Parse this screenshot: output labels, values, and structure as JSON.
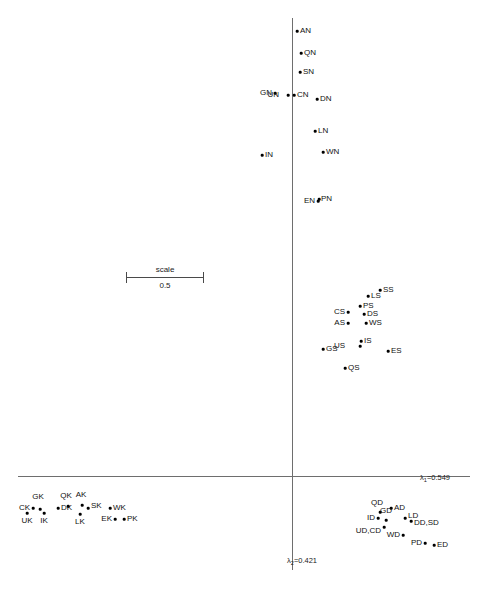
{
  "chart_data": {
    "type": "scatter",
    "title": "",
    "xlabel": "λ₁=0.549",
    "ylabel": "λ₂=0.421",
    "axis": {
      "horizontal_label": "λ",
      "horizontal_sub": "1",
      "horizontal_value": "=0.549",
      "vertical_label": "λ",
      "vertical_sub": "2",
      "vertical_value": "=0.421",
      "origin_x_px": 292,
      "origin_y_px": 476,
      "grid": false,
      "legend": "none"
    },
    "scale_bar": {
      "caption": "scale",
      "value": "0.5",
      "x_start_px": 126,
      "x_end_px": 203,
      "y_px": 277
    },
    "points": [
      {
        "label": "AN",
        "x": 297,
        "y": 31,
        "lx": 300,
        "ly": 31,
        "pos": "right"
      },
      {
        "label": "QN",
        "x": 301,
        "y": 53,
        "lx": 304,
        "ly": 53,
        "pos": "right"
      },
      {
        "label": "SN",
        "x": 300,
        "y": 72,
        "lx": 303,
        "ly": 72,
        "pos": "right"
      },
      {
        "label": "GN",
        "x": 275,
        "y": 93,
        "lx": 272,
        "ly": 93,
        "pos": "left"
      },
      {
        "label": "UN",
        "x": 288,
        "y": 95,
        "lx": 279,
        "ly": 95,
        "pos": "left-inline"
      },
      {
        "label": "CN",
        "x": 294,
        "y": 95,
        "lx": 297,
        "ly": 95,
        "pos": "right"
      },
      {
        "label": "DN",
        "x": 317,
        "y": 99,
        "lx": 320,
        "ly": 99,
        "pos": "right"
      },
      {
        "label": "LN",
        "x": 315,
        "y": 131,
        "lx": 318,
        "ly": 131,
        "pos": "right"
      },
      {
        "label": "WN",
        "x": 323,
        "y": 152,
        "lx": 326,
        "ly": 152,
        "pos": "right"
      },
      {
        "label": "IN",
        "x": 262,
        "y": 155,
        "lx": 265,
        "ly": 155,
        "pos": "right"
      },
      {
        "label": "EN",
        "x": 318,
        "y": 201,
        "lx": 315,
        "ly": 201,
        "pos": "left"
      },
      {
        "label": "PN",
        "x": 319,
        "y": 199,
        "lx": 321,
        "ly": 199,
        "pos": "right"
      },
      {
        "label": "SS",
        "x": 380,
        "y": 290,
        "lx": 383,
        "ly": 290,
        "pos": "right"
      },
      {
        "label": "LS",
        "x": 368,
        "y": 296,
        "lx": 371,
        "ly": 296,
        "pos": "right"
      },
      {
        "label": "PS",
        "x": 360,
        "y": 306,
        "lx": 363,
        "ly": 306,
        "pos": "right"
      },
      {
        "label": "CS",
        "x": 348,
        "y": 312,
        "lx": 345,
        "ly": 312,
        "pos": "left"
      },
      {
        "label": "DS",
        "x": 364,
        "y": 314,
        "lx": 367,
        "ly": 314,
        "pos": "right"
      },
      {
        "label": "AS",
        "x": 348,
        "y": 323,
        "lx": 345,
        "ly": 323,
        "pos": "left"
      },
      {
        "label": "WS",
        "x": 366,
        "y": 323,
        "lx": 369,
        "ly": 323,
        "pos": "right"
      },
      {
        "label": "IS",
        "x": 361,
        "y": 341,
        "lx": 364,
        "ly": 341,
        "pos": "right"
      },
      {
        "label": "GS",
        "x": 323,
        "y": 349,
        "lx": 326,
        "ly": 349,
        "pos": "right"
      },
      {
        "label": "US",
        "x": 360,
        "y": 346,
        "lx": 345,
        "ly": 346,
        "pos": "left-inline"
      },
      {
        "label": "ES",
        "x": 388,
        "y": 351,
        "lx": 391,
        "ly": 351,
        "pos": "right"
      },
      {
        "label": "QS",
        "x": 345,
        "y": 368,
        "lx": 348,
        "ly": 368,
        "pos": "right"
      },
      {
        "label": "CK",
        "x": 33,
        "y": 508,
        "lx": 30,
        "ly": 508,
        "pos": "left"
      },
      {
        "label": "GK",
        "x": 40,
        "y": 509,
        "lx": 38,
        "ly": 501,
        "pos": "above"
      },
      {
        "label": "UK",
        "x": 27,
        "y": 513,
        "lx": 27,
        "ly": 517,
        "pos": "below"
      },
      {
        "label": "IK",
        "x": 44,
        "y": 513,
        "lx": 44,
        "ly": 517,
        "pos": "below"
      },
      {
        "label": "DK",
        "x": 58,
        "y": 508,
        "lx": 61,
        "ly": 508,
        "pos": "right"
      },
      {
        "label": "QK",
        "x": 68,
        "y": 506,
        "lx": 66,
        "ly": 500,
        "pos": "above"
      },
      {
        "label": "AK",
        "x": 82,
        "y": 505,
        "lx": 81,
        "ly": 499,
        "pos": "above"
      },
      {
        "label": "SK",
        "x": 88,
        "y": 508,
        "lx": 91,
        "ly": 506,
        "pos": "right"
      },
      {
        "label": "LK",
        "x": 80,
        "y": 514,
        "lx": 80,
        "ly": 518,
        "pos": "below"
      },
      {
        "label": "WK",
        "x": 110,
        "y": 508,
        "lx": 113,
        "ly": 508,
        "pos": "right"
      },
      {
        "label": "EK",
        "x": 115,
        "y": 519,
        "lx": 112,
        "ly": 519,
        "pos": "left"
      },
      {
        "label": "PK",
        "x": 124,
        "y": 519,
        "lx": 127,
        "ly": 519,
        "pos": "right"
      },
      {
        "label": "QD",
        "x": 380,
        "y": 512,
        "lx": 377,
        "ly": 507,
        "pos": "above"
      },
      {
        "label": "AD",
        "x": 391,
        "y": 508,
        "lx": 394,
        "ly": 508,
        "pos": "right"
      },
      {
        "label": "ID",
        "x": 378,
        "y": 518,
        "lx": 375,
        "ly": 518,
        "pos": "left"
      },
      {
        "label": "GD",
        "x": 386,
        "y": 520,
        "lx": 386,
        "ly": 515,
        "pos": "above"
      },
      {
        "label": "LD",
        "x": 405,
        "y": 518,
        "lx": 408,
        "ly": 516,
        "pos": "right"
      },
      {
        "label": "DD,SD",
        "x": 411,
        "y": 521,
        "lx": 414,
        "ly": 523,
        "pos": "right"
      },
      {
        "label": "UD,CD",
        "x": 384,
        "y": 527,
        "lx": 381,
        "ly": 531,
        "pos": "left-below"
      },
      {
        "label": "WD",
        "x": 403,
        "y": 535,
        "lx": 400,
        "ly": 535,
        "pos": "left"
      },
      {
        "label": "PD",
        "x": 425,
        "y": 543,
        "lx": 422,
        "ly": 543,
        "pos": "left"
      },
      {
        "label": "ED",
        "x": 434,
        "y": 545,
        "lx": 437,
        "ly": 545,
        "pos": "right"
      }
    ]
  }
}
